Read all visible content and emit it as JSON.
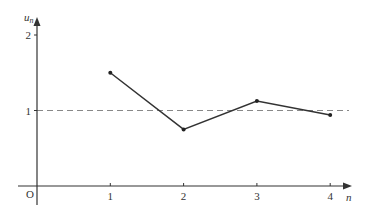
{
  "chart_data": {
    "type": "line",
    "title": "",
    "xlabel": "n",
    "ylabel": "u_n",
    "x": [
      1,
      2,
      3,
      4
    ],
    "series": [
      {
        "name": "u_n",
        "values": [
          1.5,
          0.75,
          1.125,
          0.94
        ]
      }
    ],
    "xticks": [
      "1",
      "2",
      "3",
      "4"
    ],
    "yticks": [
      "1",
      "2"
    ],
    "origin_label": "O",
    "reference_line": {
      "y": 1,
      "style": "dashed"
    },
    "xlim": [
      0,
      4.3
    ],
    "ylim": [
      0,
      2.2
    ],
    "grid": false,
    "legend": false
  },
  "colors": {
    "axis": "#333333",
    "line": "#333333",
    "dashed": "#888888"
  }
}
